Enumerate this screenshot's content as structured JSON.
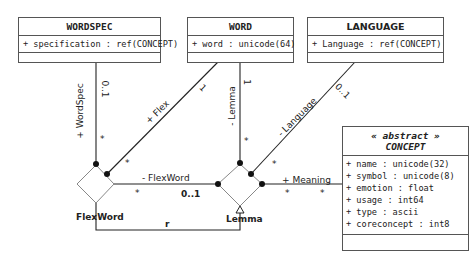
{
  "classes": {
    "wordspec": {
      "name": "WORDSPEC",
      "attributes": [
        "+ specification : ref(CONCEPT)"
      ]
    },
    "word": {
      "name": "WORD",
      "attributes": [
        "+ word : unicode(64)"
      ]
    },
    "language": {
      "name": "LANGUAGE",
      "attributes": [
        "+ Language : ref(CONCEPT)"
      ]
    },
    "concept": {
      "stereotype": "« abstract »",
      "name": "CONCEPT",
      "attributes": [
        "+ name : unicode(32)",
        "+ symbol : unicode(8)",
        "+ emotion : float",
        "+ usage : int64",
        "+ type : ascii",
        "+ coreconcept : int8"
      ]
    }
  },
  "associations": {
    "flexword_node": {
      "name": "FlexWord"
    },
    "lemma_node": {
      "name": "Lemma"
    },
    "wordspec_role": {
      "role": "+ WordSpec",
      "mult_top": "0..1",
      "mult_bottom": "*"
    },
    "flex_role": {
      "role": "+ Flex",
      "mult_top": "1",
      "mult_bottom": "*"
    },
    "lemma_role": {
      "role": "- Lemma",
      "mult_top": "1",
      "mult_bottom": "*"
    },
    "language_role": {
      "role": "- Language",
      "mult_top": "0..1",
      "mult_bottom": "*"
    },
    "flexword_role": {
      "role": "- FlexWord",
      "mult_left": "*",
      "mult_right": "0..1"
    },
    "meaning_role": {
      "role": "+ Meaning",
      "mult_left": "*",
      "mult_right": "*"
    },
    "r_link": {
      "label": "r"
    }
  }
}
